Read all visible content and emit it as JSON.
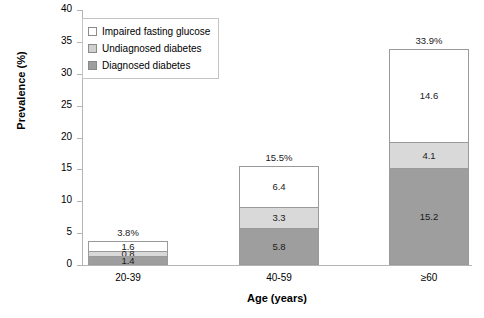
{
  "chart_data": {
    "type": "bar",
    "subtype": "stacked",
    "title": "",
    "xlabel": "Age (years)",
    "ylabel": "Prevalence (%)",
    "categories": [
      "20-39",
      "40-59",
      "≥60"
    ],
    "ylim": [
      0,
      40
    ],
    "yticks": [
      0,
      5,
      10,
      15,
      20,
      25,
      30,
      35,
      40
    ],
    "ytick_labels": [
      "0",
      "5",
      "10",
      "15",
      "20",
      "25",
      "30",
      "35",
      "40"
    ],
    "grid": false,
    "legend_position": "upper-left-inside",
    "series": [
      {
        "name": "Diagnosed diabetes",
        "color": "#9e9e9e",
        "values": [
          1.4,
          5.8,
          15.2
        ],
        "labels": [
          "1.4",
          "5.8",
          "15.2"
        ]
      },
      {
        "name": "Undiagnosed diabetes",
        "color": "#d9d9d9",
        "values": [
          0.8,
          3.3,
          4.1
        ],
        "labels": [
          "0.8",
          "3.3",
          "4.1"
        ]
      },
      {
        "name": "Impaired fasting glucose",
        "color": "#ffffff",
        "values": [
          1.6,
          6.4,
          14.6
        ],
        "labels": [
          "1.6",
          "6.4",
          "14.6"
        ]
      }
    ],
    "totals": [
      3.8,
      15.5,
      33.9
    ],
    "total_labels": [
      "3.8%",
      "15.5%",
      "33.9%"
    ]
  },
  "legend": {
    "items": [
      {
        "label": "Impaired fasting glucose",
        "swatch": "ifg"
      },
      {
        "label": "Undiagnosed diabetes",
        "swatch": "undx"
      },
      {
        "label": "Diagnosed diabetes",
        "swatch": "dx"
      }
    ]
  },
  "axes": {
    "y_title": "Prevalence (%)",
    "x_title": "Age (years)"
  }
}
